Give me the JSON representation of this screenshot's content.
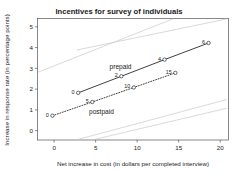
{
  "chart_data": {
    "type": "line",
    "title": "Incentives for survey of individuals",
    "xlabel": "Net increase in cost (in dollars per completed interview)",
    "ylabel": "Increase in response rate (in percentage points)",
    "xlim": [
      -2,
      21
    ],
    "ylim": [
      -0.45,
      5.4
    ],
    "xticks": [
      0,
      5,
      10,
      15,
      20
    ],
    "yticks": [
      0,
      1,
      2,
      3,
      4,
      5
    ],
    "xticklabels": [
      "0",
      "5",
      "10",
      "15",
      "20"
    ],
    "yticklabels": [
      "0",
      "1",
      "2",
      "3",
      "4",
      "5"
    ],
    "grid": false,
    "legend_position": "inline-annotations",
    "series": [
      {
        "name": "prepaid",
        "style": "solid",
        "label_text": "prepaid",
        "label_x": 8.0,
        "label_y": 2.95,
        "x": [
          2.9,
          8.1,
          13.3,
          18.6
        ],
        "y": [
          1.82,
          2.62,
          3.42,
          4.22
        ],
        "point_labels": [
          "0",
          "2",
          "4",
          "6"
        ]
      },
      {
        "name": "postpaid",
        "style": "dotted",
        "label_text": "postpaid",
        "label_x": 5.7,
        "label_y": 0.82,
        "x": [
          -0.2,
          4.6,
          9.6,
          14.6
        ],
        "y": [
          0.72,
          1.38,
          2.08,
          2.78
        ],
        "point_labels": [
          "0",
          "5",
          "10",
          "15"
        ]
      }
    ],
    "background_curves": [
      {
        "name": "upper-ref-1",
        "x": [
          2.7,
          20.8
        ],
        "y": [
          3.88,
          5.38
        ]
      },
      {
        "name": "upper-ref-2",
        "x": [
          -1.9,
          14.3
        ],
        "y": [
          2.82,
          5.38
        ]
      },
      {
        "name": "lower-ref-1",
        "x": [
          2.9,
          20.8
        ],
        "y": [
          -0.42,
          1.5
        ]
      },
      {
        "name": "lower-ref-2",
        "x": [
          4.9,
          20.8
        ],
        "y": [
          -0.42,
          1.08
        ]
      }
    ]
  }
}
